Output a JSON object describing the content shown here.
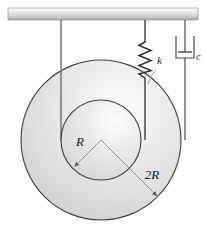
{
  "figure": {
    "background_color": "#ffffff",
    "width": 206,
    "height": 237
  },
  "ceiling": {
    "name": "fixed support ceiling",
    "x": 8,
    "y": 8,
    "width": 190,
    "height": 12,
    "fill_top": "#ffffff",
    "fill_mid": "#d8d8d8",
    "fill_bottom": "#a9a9a9",
    "border_color": "#8f8f8f"
  },
  "disk": {
    "name": "stepped disk",
    "center_x": 101,
    "center_y": 140,
    "outer_radius": 80,
    "inner_radius": 40,
    "outline_color": "#3d3d3d",
    "fill_light": "#fbfbfb",
    "fill_mid": "#e3e3e3",
    "fill_dark": "#c9c9c9"
  },
  "labels": {
    "inner_radius": "R",
    "outer_radius": "2R",
    "spring": "k",
    "damper": "c"
  },
  "cable": {
    "name": "cable",
    "x": 61,
    "top_y": 20,
    "bottom_y": 140,
    "color": "#6b6b6b",
    "width": 1.3
  },
  "spring": {
    "name": "spring",
    "x": 145,
    "top_y": 20,
    "coil_top_y": 42,
    "coil_bottom_y": 78,
    "bottom_y": 140,
    "coils": 7,
    "amplitude": 6,
    "color": "#2f2f2f",
    "width": 1.4
  },
  "damper": {
    "name": "damper dashpot",
    "x": 185,
    "top_y": 20,
    "bottom_y": 140,
    "cylinder_top_y": 36,
    "cylinder_bottom_y": 58,
    "cylinder_half_width": 9,
    "piston_y": 52,
    "piston_half_width": 7,
    "color": "#4a4a4a",
    "width": 1.2
  },
  "radius_markers": {
    "inner": {
      "from_x": 101,
      "from_y": 140,
      "to_x": 73,
      "to_y": 168,
      "label_x": 80,
      "label_y": 146
    },
    "outer": {
      "from_x": 101,
      "from_y": 140,
      "to_x": 158,
      "to_y": 197,
      "label_x": 150,
      "label_y": 180
    }
  }
}
